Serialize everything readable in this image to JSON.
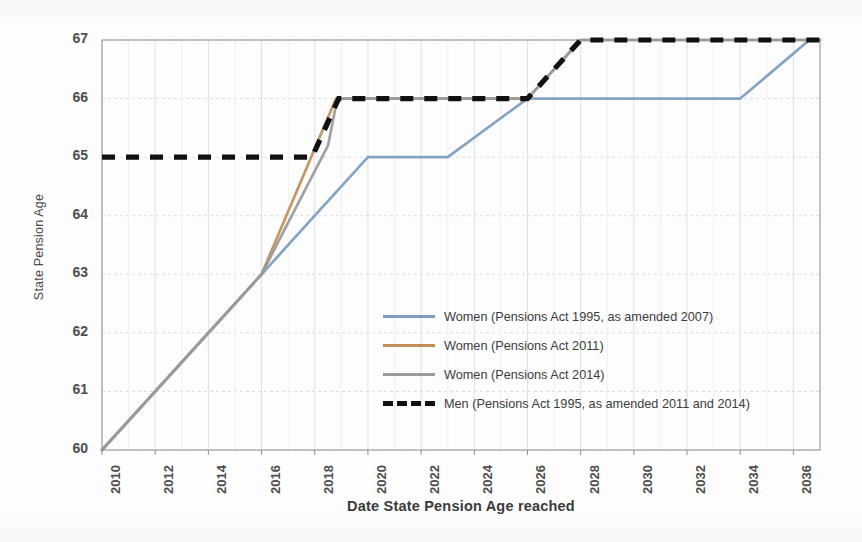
{
  "chart_data": {
    "type": "line",
    "title": "",
    "xlabel": "Date State Pension Age reached",
    "ylabel": "State Pension Age",
    "xlim": [
      2010,
      2037
    ],
    "ylim": [
      60,
      67
    ],
    "xticks": [
      "2010",
      "2012",
      "2014",
      "2016",
      "2018",
      "2020",
      "2022",
      "2024",
      "2026",
      "2028",
      "2030",
      "2032",
      "2034",
      "2036"
    ],
    "yticks": [
      "60",
      "61",
      "62",
      "63",
      "64",
      "65",
      "66",
      "67"
    ],
    "grid": true,
    "legend_position": "center",
    "series": [
      {
        "name": "Women (Pensions Act 1995, as amended 2007)",
        "color": "#7c9dc0",
        "style": "solid",
        "points": [
          [
            2010,
            60.0
          ],
          [
            2016.0,
            63.0
          ],
          [
            2018.0,
            64.0
          ],
          [
            2020.0,
            65.0
          ],
          [
            2023.0,
            65.0
          ],
          [
            2026.0,
            66.0
          ],
          [
            2034.0,
            66.0
          ],
          [
            2036.6,
            67.0
          ],
          [
            2037.0,
            67.0
          ]
        ]
      },
      {
        "name": "Women (Pensions Act 2011)",
        "color": "#bf8f57",
        "style": "solid",
        "points": [
          [
            2010,
            60.0
          ],
          [
            2016.0,
            63.0
          ],
          [
            2018.8,
            66.0
          ],
          [
            2026.0,
            66.0
          ],
          [
            2028.0,
            67.0
          ],
          [
            2037.0,
            67.0
          ]
        ]
      },
      {
        "name": "Women (Pensions Act 2014)",
        "color": "#9a9a9a",
        "style": "solid",
        "points": [
          [
            2010,
            60.0
          ],
          [
            2016.0,
            63.0
          ],
          [
            2018.5,
            65.2
          ],
          [
            2018.85,
            66.0
          ],
          [
            2026.0,
            66.0
          ],
          [
            2028.0,
            67.0
          ],
          [
            2037.0,
            67.0
          ]
        ]
      },
      {
        "name": "Men (Pensions Act 1995, as amended 2011 and 2014)",
        "color": "#111111",
        "style": "dashed",
        "points": [
          [
            2010,
            65.0
          ],
          [
            2017.9,
            65.0
          ],
          [
            2018.9,
            66.0
          ],
          [
            2026.0,
            66.0
          ],
          [
            2028.0,
            67.0
          ],
          [
            2037.0,
            67.0
          ]
        ]
      }
    ]
  },
  "legend": {
    "items": [
      {
        "label": "Women (Pensions Act 1995, as amended 2007)",
        "color": "#7c9dc0",
        "style": "solid"
      },
      {
        "label": "Women (Pensions Act 2011)",
        "color": "#bf8f57",
        "style": "solid"
      },
      {
        "label": "Women (Pensions Act 2014)",
        "color": "#9a9a9a",
        "style": "solid"
      },
      {
        "label": "Men (Pensions Act 1995, as amended 2011 and 2014)",
        "color": "#111111",
        "style": "dashed"
      }
    ]
  }
}
